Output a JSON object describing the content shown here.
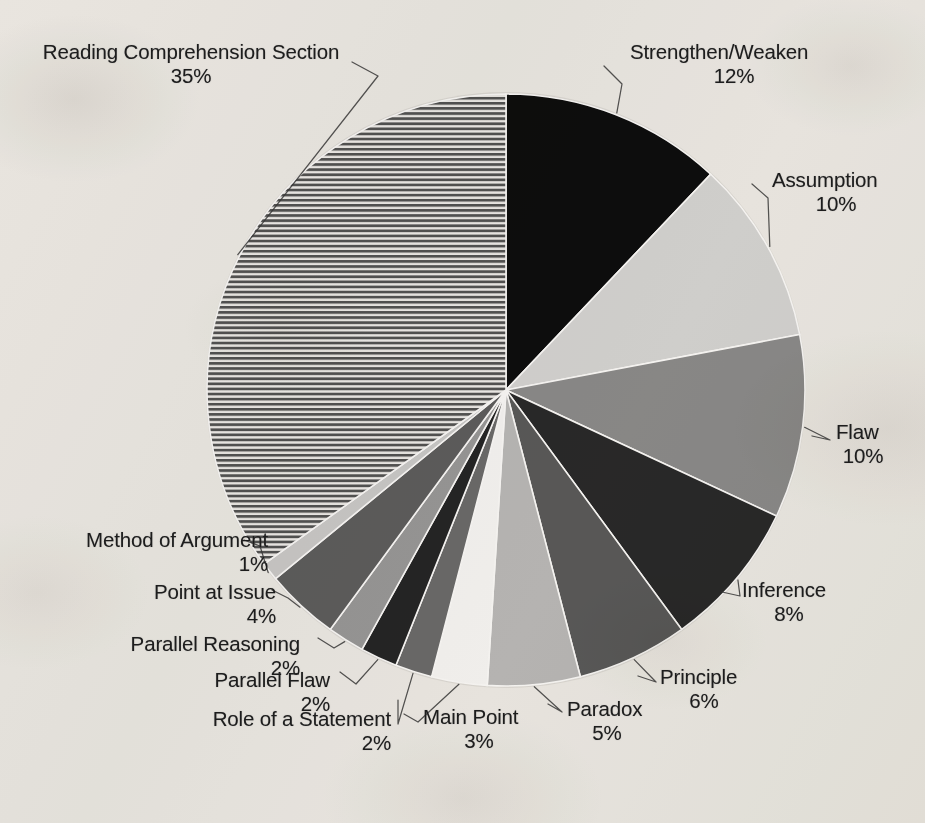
{
  "chart_data": {
    "type": "pie",
    "title": "",
    "legend_position": "callout-labels",
    "start_angle_deg": 0,
    "direction": "clockwise",
    "value_unit": "%",
    "total": 100,
    "categories": [
      "Strengthen/Weaken",
      "Assumption",
      "Flaw",
      "Inference",
      "Principle",
      "Paradox",
      "Main Point",
      "Role of a Statement",
      "Parallel Flaw",
      "Parallel Reasoning",
      "Point at Issue",
      "Method of Argument",
      "Reading Comprehension Section"
    ],
    "values": [
      12,
      10,
      10,
      8,
      6,
      5,
      3,
      2,
      2,
      2,
      4,
      1,
      35
    ],
    "slice_fills": [
      "#0b0b0b",
      "#d9d9d9",
      "#8e8e8e",
      "#2b2b2b",
      "#5b5b5b",
      "#bdbdbd",
      "#fbfbfb",
      "#6d6d6d",
      "#272727",
      "#9c9c9c",
      "#616161",
      "#cfcfcf",
      "hatch-horizontal"
    ],
    "slices": [
      {
        "label": "Strengthen/Weaken",
        "percent": "12%",
        "value": 12
      },
      {
        "label": "Assumption",
        "percent": "10%",
        "value": 10
      },
      {
        "label": "Flaw",
        "percent": "10%",
        "value": 10
      },
      {
        "label": "Inference",
        "percent": "8%",
        "value": 8
      },
      {
        "label": "Principle",
        "percent": "6%",
        "value": 6
      },
      {
        "label": "Paradox",
        "percent": "5%",
        "value": 5
      },
      {
        "label": "Main Point",
        "percent": "3%",
        "value": 3
      },
      {
        "label": "Role of a Statement",
        "percent": "2%",
        "value": 2
      },
      {
        "label": "Parallel Flaw",
        "percent": "2%",
        "value": 2
      },
      {
        "label": "Parallel Reasoning",
        "percent": "2%",
        "value": 2
      },
      {
        "label": "Point at Issue",
        "percent": "4%",
        "value": 4
      },
      {
        "label": "Method of Argument",
        "percent": "1%",
        "value": 1
      },
      {
        "label": "Reading Comprehension Section",
        "percent": "35%",
        "value": 35
      }
    ]
  },
  "colors": {
    "background": "#f2f0ec",
    "text": "#1d1d1d",
    "leader_line": "#3a3a3a",
    "slice_outline": "#ffffff"
  }
}
